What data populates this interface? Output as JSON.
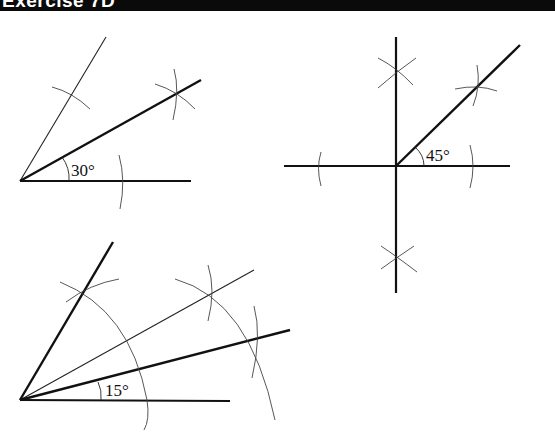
{
  "header": {
    "title": "Exercise 7D"
  },
  "figures": [
    {
      "id": "bisect-60",
      "angle_label": "30°"
    },
    {
      "id": "bisect-90",
      "angle_label": "45°"
    },
    {
      "id": "bisect-30",
      "angle_label": "15°"
    }
  ],
  "colors": {
    "ink": "#111111",
    "construction": "#444444",
    "header_bg": "#0a0a0a"
  }
}
